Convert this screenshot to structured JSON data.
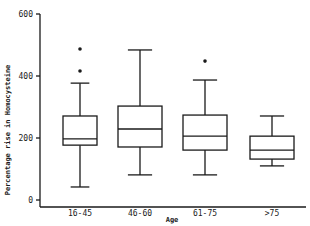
{
  "chart_data": {
    "type": "box",
    "title": "",
    "xlabel": "Age",
    "ylabel": "Percentage rise in Homocysteine",
    "ylim": [
      0,
      600
    ],
    "yticks": [
      0,
      200,
      400,
      600
    ],
    "grid": false,
    "legend": null,
    "categories": [
      "16-45",
      "46-60",
      "61-75",
      ">75"
    ],
    "boxes": [
      {
        "category": "16-45",
        "whisker_low": 42,
        "q1": 177,
        "median": 197,
        "q3": 271,
        "whisker_high": 377,
        "outliers": [
          416,
          487
        ]
      },
      {
        "category": "46-60",
        "whisker_low": 81,
        "q1": 171,
        "median": 229,
        "q3": 303,
        "whisker_high": 484,
        "outliers": []
      },
      {
        "category": "61-75",
        "whisker_low": 81,
        "q1": 161,
        "median": 206,
        "q3": 274,
        "whisker_high": 387,
        "outliers": [
          448
        ]
      },
      {
        "category": ">75",
        "whisker_low": 110,
        "q1": 132,
        "median": 161,
        "q3": 206,
        "whisker_high": 271,
        "outliers": []
      }
    ]
  },
  "labels": {
    "xlabel": "Age",
    "ylabel": "Percentage rise in Homocysteine",
    "yticks": [
      "0",
      "200",
      "400",
      "600"
    ],
    "categories": [
      "16-45",
      "46-60",
      "61-75",
      ">75"
    ]
  }
}
